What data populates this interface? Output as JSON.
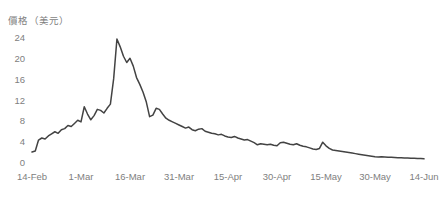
{
  "chart_data": {
    "type": "line",
    "title": "價格（美元）",
    "xlabel": "",
    "ylabel": "價格（美元）",
    "ylim": [
      0,
      24
    ],
    "yticks": [
      0,
      4,
      8,
      12,
      16,
      20,
      24
    ],
    "xticks": [
      "14-Feb",
      "1-Mar",
      "16-Mar",
      "31-Mar",
      "15-Apr",
      "30-Apr",
      "15-May",
      "30-May",
      "14-Jun"
    ],
    "grid": false,
    "legend": "none",
    "line_color": "#434343",
    "axis_text_color": "#808080",
    "background_color": "#ffffff",
    "series": [
      {
        "name": "價格",
        "x": [
          "14-Feb",
          "15-Feb",
          "16-Feb",
          "17-Feb",
          "18-Feb",
          "19-Feb",
          "20-Feb",
          "21-Feb",
          "22-Feb",
          "23-Feb",
          "24-Feb",
          "25-Feb",
          "26-Feb",
          "27-Feb",
          "28-Feb",
          "1-Mar",
          "2-Mar",
          "3-Mar",
          "4-Mar",
          "5-Mar",
          "6-Mar",
          "7-Mar",
          "8-Mar",
          "9-Mar",
          "10-Mar",
          "11-Mar",
          "12-Mar",
          "13-Mar",
          "14-Mar",
          "15-Mar",
          "16-Mar",
          "17-Mar",
          "18-Mar",
          "19-Mar",
          "20-Mar",
          "21-Mar",
          "22-Mar",
          "23-Mar",
          "24-Mar",
          "25-Mar",
          "26-Mar",
          "27-Mar",
          "28-Mar",
          "29-Mar",
          "30-Mar",
          "31-Mar",
          "1-Apr",
          "2-Apr",
          "3-Apr",
          "4-Apr",
          "5-Apr",
          "6-Apr",
          "7-Apr",
          "8-Apr",
          "9-Apr",
          "10-Apr",
          "11-Apr",
          "12-Apr",
          "13-Apr",
          "14-Apr",
          "15-Apr",
          "16-Apr",
          "17-Apr",
          "18-Apr",
          "19-Apr",
          "20-Apr",
          "21-Apr",
          "22-Apr",
          "23-Apr",
          "24-Apr",
          "25-Apr",
          "26-Apr",
          "27-Apr",
          "28-Apr",
          "29-Apr",
          "30-Apr",
          "1-May",
          "2-May",
          "3-May",
          "4-May",
          "5-May",
          "6-May",
          "7-May",
          "8-May",
          "9-May",
          "10-May",
          "11-May",
          "12-May",
          "13-May",
          "14-May",
          "15-May",
          "16-May",
          "17-May",
          "18-May",
          "19-May",
          "20-May",
          "21-May",
          "22-May",
          "23-May",
          "24-May",
          "25-May",
          "26-May",
          "27-May",
          "28-May",
          "29-May",
          "30-May",
          "31-May",
          "1-Jun",
          "2-Jun",
          "3-Jun",
          "4-Jun",
          "5-Jun",
          "6-Jun",
          "7-Jun",
          "8-Jun",
          "9-Jun",
          "10-Jun",
          "11-Jun",
          "12-Jun",
          "13-Jun",
          "14-Jun"
        ],
        "values": [
          2.1,
          2.3,
          4.4,
          4.8,
          4.6,
          5.2,
          5.6,
          6.0,
          5.7,
          6.4,
          6.6,
          7.2,
          7.0,
          7.6,
          8.2,
          7.9,
          10.8,
          9.4,
          8.3,
          9.1,
          10.3,
          10.1,
          9.6,
          10.5,
          11.3,
          16.2,
          23.8,
          22.3,
          20.5,
          19.3,
          20.1,
          18.6,
          16.4,
          15.1,
          13.6,
          11.7,
          8.9,
          9.2,
          10.5,
          10.3,
          9.4,
          8.6,
          8.2,
          7.9,
          7.6,
          7.3,
          7.0,
          6.7,
          6.9,
          6.4,
          6.2,
          6.5,
          6.6,
          6.1,
          5.9,
          5.7,
          5.6,
          5.4,
          5.5,
          5.2,
          5.0,
          4.9,
          5.1,
          4.8,
          4.6,
          4.4,
          4.5,
          4.2,
          3.9,
          3.5,
          3.7,
          3.6,
          3.5,
          3.6,
          3.4,
          3.3,
          3.9,
          4.0,
          3.8,
          3.6,
          3.5,
          3.7,
          3.4,
          3.2,
          3.1,
          2.9,
          2.7,
          2.6,
          2.8,
          4.0,
          3.3,
          2.8,
          2.5,
          2.4,
          2.3,
          2.2,
          2.1,
          2.0,
          1.9,
          1.8,
          1.7,
          1.6,
          1.5,
          1.4,
          1.3,
          1.2,
          1.15,
          1.2,
          1.15,
          1.1,
          1.1,
          1.05,
          1.0,
          1.0,
          0.95,
          0.95,
          0.9,
          0.9,
          0.85,
          0.85,
          0.8
        ]
      }
    ]
  }
}
